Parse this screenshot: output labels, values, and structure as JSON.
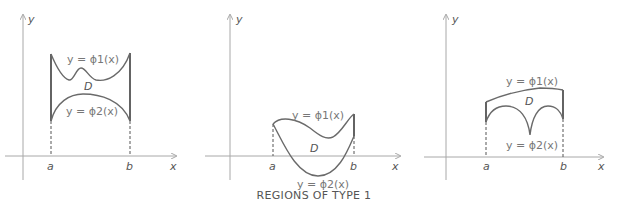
{
  "caption": "REGIONS OF TYPE 1",
  "axis_labels": {
    "x": "x",
    "y": "y"
  },
  "bounds": {
    "a": "a",
    "b": "b"
  },
  "panels": [
    {
      "upper": "y = ϕ1(x)",
      "region": "D",
      "lower": "y = ϕ2(x)"
    },
    {
      "upper": "y = ϕ1(x)",
      "region": "D",
      "lower": "y = ϕ2(x)"
    },
    {
      "upper": "y = ϕ1(x)",
      "region": "D",
      "lower": "y = ϕ2(x)"
    }
  ],
  "colors": {
    "axis": "#a8a8a8",
    "curve": "#6a6a6a",
    "edge": "#222222"
  }
}
